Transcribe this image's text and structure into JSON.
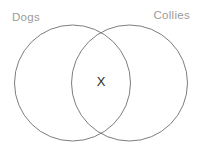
{
  "diagram": {
    "type": "venn-diagram",
    "background_color": "#ffffff",
    "stroke_color": "#6e6e6e",
    "label_color": "#9b9b9b",
    "mark_color": "#2b2b2b",
    "sets": [
      {
        "id": "dogs",
        "label": "Dogs",
        "label_position": "top-left",
        "center_x": 72.5,
        "center_y": 83,
        "radius": 58
      },
      {
        "id": "collies",
        "label": "Collies",
        "label_position": "top-right",
        "center_x": 129.5,
        "center_y": 83,
        "radius": 58
      }
    ],
    "marks": [
      {
        "id": "intersection-mark",
        "symbol": "X",
        "region": "intersection",
        "x": 101,
        "y": 82
      }
    ]
  }
}
